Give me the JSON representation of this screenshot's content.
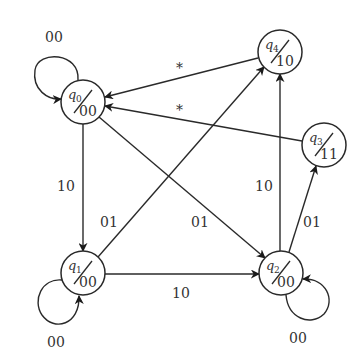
{
  "diagram": {
    "type": "state-machine (Moore)",
    "nodes": [
      {
        "id": "q0",
        "name": "q",
        "sub": "0",
        "output": "00",
        "cx": 83,
        "cy": 102
      },
      {
        "id": "q1",
        "name": "q",
        "sub": "1",
        "output": "00",
        "cx": 83,
        "cy": 273
      },
      {
        "id": "q2",
        "name": "q",
        "sub": "2",
        "output": "00",
        "cx": 281,
        "cy": 273
      },
      {
        "id": "q3",
        "name": "q",
        "sub": "3",
        "output": "11",
        "cx": 324,
        "cy": 145
      },
      {
        "id": "q4",
        "name": "q",
        "sub": "4",
        "output": "10",
        "cx": 280,
        "cy": 52
      }
    ],
    "edges": [
      {
        "from": "q0",
        "to": "q0",
        "label": "00"
      },
      {
        "from": "q0",
        "to": "q1",
        "label": "10"
      },
      {
        "from": "q0",
        "to": "q2",
        "label": "01"
      },
      {
        "from": "q1",
        "to": "q1",
        "label": "00"
      },
      {
        "from": "q1",
        "to": "q4",
        "label": "01"
      },
      {
        "from": "q1",
        "to": "q2",
        "label": "10"
      },
      {
        "from": "q2",
        "to": "q2",
        "label": "00"
      },
      {
        "from": "q2",
        "to": "q4",
        "label": "10"
      },
      {
        "from": "q2",
        "to": "q3",
        "label": "01"
      },
      {
        "from": "q4",
        "to": "q0",
        "label": "*"
      },
      {
        "from": "q3",
        "to": "q0",
        "label": "*"
      }
    ],
    "labels": {
      "q0_loop": "00",
      "q0_q1": "10",
      "q0_q2": "01",
      "q1_loop": "00",
      "q1_q4": "01",
      "q1_q2": "10",
      "q2_loop": "00",
      "q2_q4": "10",
      "q2_q3": "01",
      "q4_q0": "*",
      "q3_q0": "*"
    },
    "colors": {
      "stroke": "#2a2a2a",
      "text": "#333333",
      "background": "#ffffff"
    }
  }
}
